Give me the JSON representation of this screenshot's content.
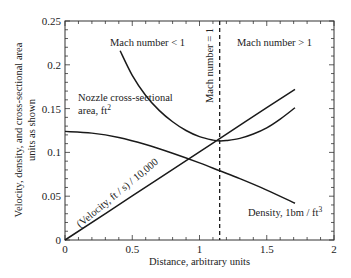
{
  "chart_data": {
    "type": "line",
    "title": "",
    "xlabel": "Distance, arbitrary units",
    "ylabel": "Velocity, density, and cross-sectional area units as shown",
    "ylabel_lines": [
      "Velocity, density, and cross-sectional area",
      "units as shown"
    ],
    "xlim": [
      0,
      2
    ],
    "ylim": [
      0,
      0.25
    ],
    "x_ticks": [
      0,
      0.5,
      1,
      1.5,
      2
    ],
    "x_tick_labels": [
      "0",
      "0.5",
      "1",
      "1.5",
      "2"
    ],
    "y_ticks": [
      0,
      0.05,
      0.1,
      0.15,
      0.2,
      0.25
    ],
    "y_tick_labels": [
      "0",
      "0.05",
      "0.1",
      "0.15",
      "0.2",
      "0.25"
    ],
    "grid": false,
    "legend": "none (inline annotations)",
    "series": [
      {
        "name": "Nozzle cross-sectional area, ft²",
        "x": [
          0.41,
          0.5,
          0.6,
          0.7,
          0.8,
          0.9,
          1.0,
          1.1,
          1.15,
          1.2,
          1.3,
          1.4,
          1.5,
          1.6,
          1.71
        ],
        "values": [
          0.216,
          0.188,
          0.165,
          0.148,
          0.135,
          0.125,
          0.118,
          0.114,
          0.113,
          0.1135,
          0.116,
          0.121,
          0.128,
          0.138,
          0.151
        ]
      },
      {
        "name": "(Velocity, ft/s) / 10,000",
        "x": [
          0,
          0.5,
          1.0,
          1.15,
          1.5,
          1.71
        ],
        "values": [
          0,
          0.0503,
          0.1006,
          0.1157,
          0.151,
          0.172
        ]
      },
      {
        "name": "Density, lbm/ft³",
        "x": [
          0,
          0.2,
          0.4,
          0.6,
          0.8,
          1.0,
          1.15,
          1.3,
          1.5,
          1.71
        ],
        "values": [
          0.124,
          0.122,
          0.117,
          0.109,
          0.099,
          0.088,
          0.079,
          0.07,
          0.057,
          0.042
        ]
      }
    ],
    "vertical_line": {
      "x": 1.15,
      "style": "dashed",
      "label": "Mach number = 1"
    },
    "annotations": [
      {
        "text": "Mach number < 1",
        "region": "subsonic"
      },
      {
        "text": "Mach number > 1",
        "region": "supersonic"
      },
      {
        "text": "Mach number = 1",
        "position": "along dashed line"
      },
      {
        "text": "Nozzle cross-sectional",
        "line2": "area, ft",
        "sup": "2"
      },
      {
        "text": "(Velocity, ft / s) / 10,000"
      },
      {
        "text": "Density, 1bm / ft",
        "sup": "3"
      }
    ]
  },
  "labels": {
    "mach_lt": "Mach number < 1",
    "mach_gt": "Mach number > 1",
    "mach_eq": "Mach number = 1",
    "area_line1": "Nozzle cross-sectional",
    "area_line2": "area, ft",
    "area_sup": "2",
    "velocity": "(Velocity, ft / s) / 10,000",
    "density": "Density, 1bm / ft",
    "density_sup": "3",
    "xlabel": "Distance, arbitrary units",
    "ylabel_1": "Velocity, density, and cross-sectional area",
    "ylabel_2": "units as shown"
  }
}
